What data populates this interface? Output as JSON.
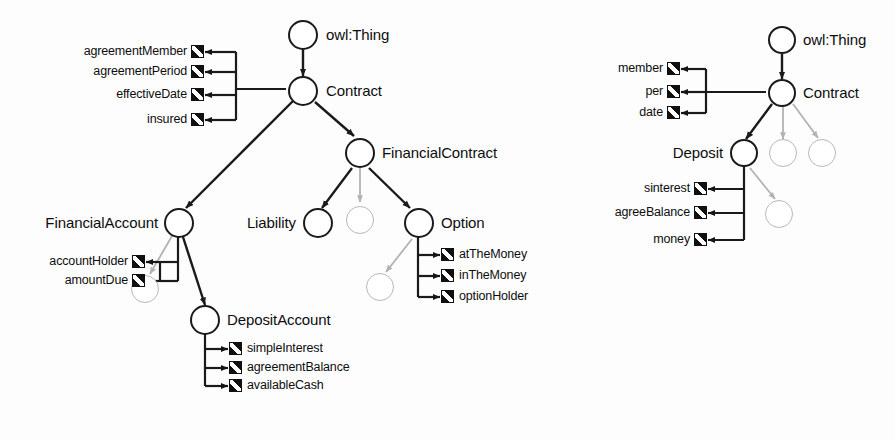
{
  "diagram": {
    "colors": {
      "background": "#fdfdfd",
      "solid_stroke": "#1a1a1a",
      "ghost_stroke": "#b8b8b8",
      "text": "#0d0d0d",
      "property_icon_fill": "#101010"
    },
    "icon_names": {
      "property": "property-slot-icon",
      "arrowhead": "arrowhead-icon"
    }
  },
  "left_diagram": {
    "name": "full-ontology-graph",
    "nodes": [
      {
        "id": "owlThing",
        "label": "owl:Thing",
        "kind": "solid",
        "label_side": "right"
      },
      {
        "id": "contract",
        "label": "Contract",
        "kind": "solid",
        "label_side": "right"
      },
      {
        "id": "financialContract",
        "label": "FinancialContract",
        "kind": "solid",
        "label_side": "right"
      },
      {
        "id": "financialAccount",
        "label": "FinancialAccount",
        "kind": "solid",
        "label_side": "left"
      },
      {
        "id": "liability",
        "label": "Liability",
        "kind": "solid",
        "label_side": "left"
      },
      {
        "id": "option",
        "label": "Option",
        "kind": "solid",
        "label_side": "right"
      },
      {
        "id": "depositAccount",
        "label": "DepositAccount",
        "kind": "solid",
        "label_side": "right"
      },
      {
        "id": "ghostFC",
        "label": "",
        "kind": "ghost",
        "label_side": "none"
      },
      {
        "id": "ghostFA",
        "label": "",
        "kind": "ghost",
        "label_side": "none"
      },
      {
        "id": "ghostOpt",
        "label": "",
        "kind": "ghost",
        "label_side": "none"
      }
    ],
    "contract_properties": [
      "agreementMember",
      "agreementPeriod",
      "effectiveDate",
      "insured"
    ],
    "financial_account_properties": [
      "accountHolder",
      "amountDue"
    ],
    "option_properties": [
      "atTheMoney",
      "inTheMoney",
      "optionHolder"
    ],
    "deposit_account_properties": [
      "simpleInterest",
      "agreementBalance",
      "availableCash"
    ]
  },
  "right_diagram": {
    "name": "reduced-ontology-graph",
    "nodes": [
      {
        "id": "owlThing2",
        "label": "owl:Thing",
        "kind": "solid",
        "label_side": "right"
      },
      {
        "id": "contract2",
        "label": "Contract",
        "kind": "solid",
        "label_side": "right"
      },
      {
        "id": "deposit2",
        "label": "Deposit",
        "kind": "solid",
        "label_side": "left"
      },
      {
        "id": "ghostC1",
        "label": "",
        "kind": "ghost",
        "label_side": "none"
      },
      {
        "id": "ghostC2",
        "label": "",
        "kind": "ghost",
        "label_side": "none"
      },
      {
        "id": "ghostD1",
        "label": "",
        "kind": "ghost",
        "label_side": "none"
      }
    ],
    "contract_properties": [
      "member",
      "per",
      "date"
    ],
    "deposit_properties": [
      "sinterest",
      "agreeBalance",
      "money"
    ]
  }
}
